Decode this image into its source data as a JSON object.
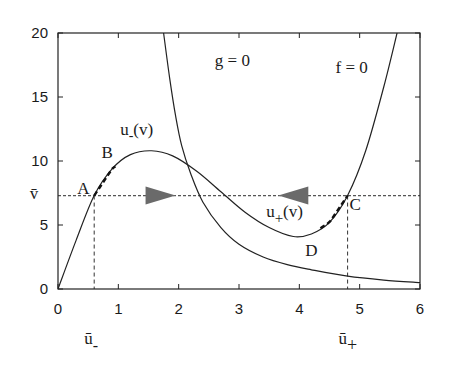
{
  "chart_data": {
    "type": "line",
    "title": "",
    "xlabel": "",
    "ylabel": "",
    "xlim": [
      0,
      6
    ],
    "ylim": [
      0,
      20
    ],
    "grid": false,
    "x_ticks": [
      0,
      1,
      2,
      3,
      4,
      5,
      6
    ],
    "x_tick_labels": [
      "0",
      "1",
      "2",
      "3",
      "4",
      "5",
      "6"
    ],
    "y_ticks": [
      0,
      5,
      10,
      15,
      20
    ],
    "y_tick_labels": [
      "0",
      "5",
      "10",
      "15",
      "20"
    ],
    "series": [
      {
        "name": "f = 0",
        "x": [
          0,
          0.3,
          0.6,
          0.9,
          1.2,
          1.55,
          1.9,
          2.3,
          2.7,
          3.1,
          3.5,
          3.9,
          4.2,
          4.5,
          4.8,
          5.1,
          5.4,
          5.62
        ],
        "y": [
          0,
          3.8,
          7.3,
          9.4,
          10.5,
          10.8,
          10.4,
          9.2,
          7.6,
          6.0,
          4.8,
          4.1,
          4.3,
          5.2,
          7.3,
          10.8,
          15.8,
          20
        ]
      },
      {
        "name": "g = 0",
        "x": [
          1.75,
          1.85,
          1.95,
          2.05,
          2.2,
          2.4,
          2.7,
          3.0,
          3.4,
          3.8,
          4.2,
          4.8,
          5.4,
          6.0
        ],
        "y": [
          20,
          16.5,
          13.5,
          11.2,
          9.0,
          6.8,
          4.8,
          3.5,
          2.5,
          1.9,
          1.5,
          1.0,
          0.7,
          0.5
        ]
      }
    ],
    "vbar_level": 7.3,
    "points": [
      {
        "label": "A",
        "x": 0.6,
        "y": 7.3
      },
      {
        "label": "B",
        "x": 0.95,
        "y": 9.6
      },
      {
        "label": "C",
        "x": 4.8,
        "y": 7.3
      },
      {
        "label": "D",
        "x": 4.35,
        "y": 4.7
      }
    ],
    "annotations": {
      "g_label": "g = 0",
      "f_label": "f = 0",
      "u_minus_label": "u",
      "u_minus_sub": "-",
      "u_minus_arg": "(v)",
      "u_plus_label": "u",
      "u_plus_sub": "+",
      "u_plus_arg": "(v)",
      "vbar_label": "v̄",
      "ubar_minus_label": "ū",
      "ubar_minus_sub": "-",
      "ubar_plus_label": "ū",
      "ubar_plus_sub": "+",
      "ubar_minus_x": 0.6,
      "ubar_plus_x": 4.8
    },
    "arrows": [
      {
        "direction": "right",
        "x": 1.7,
        "y": 7.3
      },
      {
        "direction": "left",
        "x": 3.9,
        "y": 7.3
      }
    ]
  }
}
